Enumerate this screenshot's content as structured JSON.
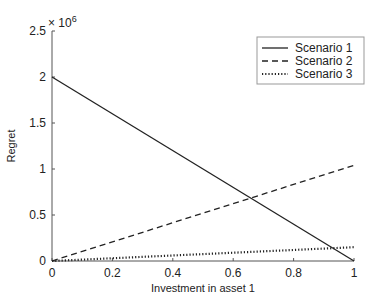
{
  "chart_data": {
    "type": "line",
    "title": "",
    "xlabel": "Investment in asset 1",
    "ylabel": "Regret",
    "y_multiplier": "× 10",
    "y_multiplier_exp": "6",
    "xlim": [
      0,
      1
    ],
    "ylim": [
      0,
      2.5
    ],
    "xticks": [
      "0",
      "0.2",
      "0.4",
      "0.6",
      "0.8",
      "1"
    ],
    "yticks": [
      "0",
      "0.5",
      "1",
      "1.5",
      "2",
      "2.5"
    ],
    "grid": false,
    "legend_position": "upper right",
    "x": [
      0,
      1
    ],
    "series": [
      {
        "name": "Scenario 1",
        "style": "solid",
        "values": [
          2.0,
          0.0
        ]
      },
      {
        "name": "Scenario 2",
        "style": "dashed",
        "values": [
          0.0,
          1.04
        ]
      },
      {
        "name": "Scenario 3",
        "style": "dotted",
        "values": [
          0.0,
          0.15
        ]
      }
    ],
    "units_note": "y values in units of 10^6"
  }
}
